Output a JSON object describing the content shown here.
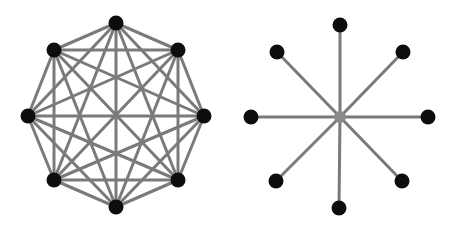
{
  "diagram": {
    "edge_color": "#7a7a7a",
    "node_color": "#0d0d0d",
    "hub_color": "#8a8a8a",
    "graphs": [
      {
        "name": "complete-graph-k8",
        "type": "complete",
        "nodes": [
          [
            116,
            23
          ],
          [
            178,
            50
          ],
          [
            204,
            116
          ],
          [
            178,
            180
          ],
          [
            116,
            207
          ],
          [
            54,
            180
          ],
          [
            28,
            116
          ],
          [
            54,
            50
          ]
        ]
      },
      {
        "name": "star-graph",
        "type": "star",
        "hub": [
          340,
          117
        ],
        "nodes": [
          [
            340,
            25
          ],
          [
            403,
            52
          ],
          [
            428,
            117
          ],
          [
            402,
            181
          ],
          [
            339,
            208
          ],
          [
            276,
            181
          ],
          [
            251,
            117
          ],
          [
            277,
            52
          ]
        ]
      }
    ]
  }
}
